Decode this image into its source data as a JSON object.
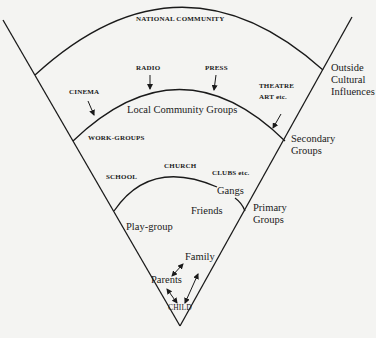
{
  "diagram": {
    "type": "nested-sector",
    "rings": [
      {
        "name": "outer",
        "label": "NATIONAL COMMUNITY",
        "side_label": [
          "Outside",
          "Cultural",
          "Influences"
        ]
      },
      {
        "name": "middle",
        "label": "Local Community Groups",
        "side_label": [
          "Secondary",
          "Groups"
        ]
      },
      {
        "name": "inner",
        "label": "Friends",
        "side_label": [
          "Primary",
          "Groups"
        ]
      }
    ],
    "labels": {
      "national_community": "NATIONAL COMMUNITY",
      "radio": "RADIO",
      "press": "PRESS",
      "cinema": "CINEMA",
      "theatre": "THEATRE",
      "art_etc": "ART etc.",
      "local_community_groups": "Local Community Groups",
      "work_groups": "WORK-GROUPS",
      "church": "CHURCH",
      "school": "SCHOOL",
      "clubs_etc": "CLUBS etc.",
      "gangs": "Gangs",
      "friends": "Friends",
      "play_group": "Play-group",
      "family": "Family",
      "parents": "Parents",
      "child": "CHILD"
    },
    "side_labels": {
      "outside_1": "Outside",
      "outside_2": "Cultural",
      "outside_3": "Influences",
      "secondary_1": "Secondary",
      "secondary_2": "Groups",
      "primary_1": "Primary",
      "primary_2": "Groups"
    },
    "arrows": [
      {
        "from": "RADIO",
        "to": "middle-arc"
      },
      {
        "from": "PRESS",
        "to": "middle-arc"
      },
      {
        "from": "CINEMA",
        "to": "middle-arc"
      },
      {
        "from": "THEATRE ART etc.",
        "to": "middle-arc"
      },
      {
        "between": [
          "Parents",
          "Family"
        ],
        "type": "double"
      },
      {
        "between": [
          "Parents",
          "CHILD"
        ],
        "type": "double"
      },
      {
        "between": [
          "CHILD",
          "Family"
        ],
        "type": "double"
      }
    ],
    "colors": {
      "ink": "#1a1a1a",
      "paper": "#f4f4f2"
    }
  }
}
